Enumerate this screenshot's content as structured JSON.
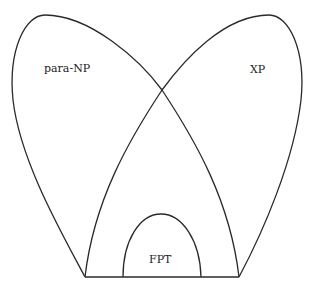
{
  "diagram": {
    "type": "venn-complexity-classes",
    "stroke_color": "#2a2a2a",
    "regions": [
      {
        "id": "para-np",
        "label": "para-NP"
      },
      {
        "id": "xp",
        "label": "XP"
      },
      {
        "id": "fpt",
        "label": "FPT"
      }
    ]
  }
}
